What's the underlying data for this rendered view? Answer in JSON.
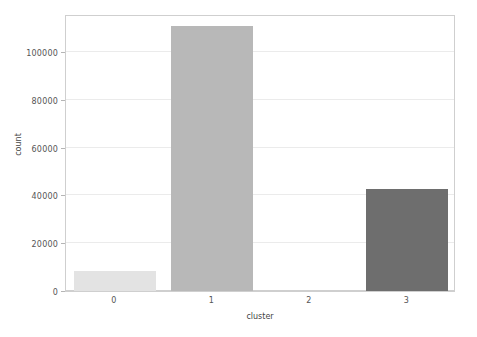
{
  "chart_data": {
    "type": "bar",
    "title": "",
    "subtitle": "",
    "xlabel": "cluster",
    "ylabel": "count",
    "categories": [
      "0",
      "1",
      "2",
      "3"
    ],
    "values": [
      8400,
      111000,
      0,
      42800
    ],
    "series": [
      {
        "name": "count",
        "values": [
          8400,
          111000,
          0,
          42800
        ]
      }
    ],
    "bar_colors": [
      "#e3e3e3",
      "#b8b8b8",
      "#d8d8d8",
      "#6e6e6e"
    ],
    "ylim": [
      0,
      116000
    ],
    "yticks": [
      0,
      20000,
      40000,
      60000,
      80000,
      100000
    ],
    "ytick_labels": [
      "0",
      "20000",
      "40000",
      "60000",
      "80000",
      "100000"
    ],
    "xtick_labels": [
      "0",
      "1",
      "2",
      "3"
    ],
    "grid": true,
    "grid_axis": "y",
    "grid_color": "#ebebeb",
    "legend": false,
    "legend_position": "none",
    "axis_color": "#cfcfcf",
    "tick_label_color": "#555555",
    "background_color": "#ffffff",
    "annotations": []
  }
}
